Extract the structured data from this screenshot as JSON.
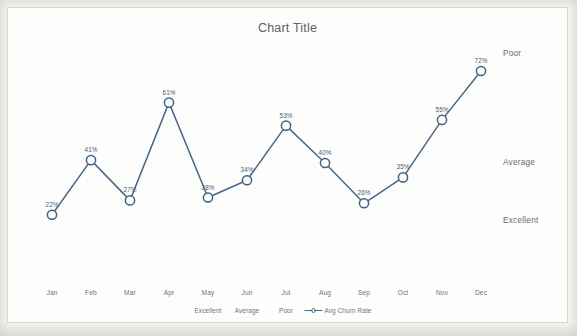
{
  "chart_data": {
    "type": "line",
    "title": "Chart Title",
    "xlabel": "",
    "ylabel": "",
    "ylim": [
      0,
      80
    ],
    "grid": false,
    "legend_position": "bottom",
    "categories": [
      "Jan",
      "Feb",
      "Mar",
      "Apr",
      "May",
      "Jun",
      "Jul",
      "Aug",
      "Sep",
      "Oct",
      "Nov",
      "Dec"
    ],
    "series": [
      {
        "name": "Avg Churn Rate",
        "values": [
          22,
          41,
          27,
          61,
          28,
          34,
          53,
          40,
          26,
          35,
          55,
          72
        ],
        "labels": [
          "22%",
          "41%",
          "27%",
          "61%",
          "28%",
          "34%",
          "53%",
          "40%",
          "26%",
          "35%",
          "55%",
          "72%"
        ],
        "color": "#46688c",
        "marker": "open-circle"
      }
    ],
    "zone_labels": [
      {
        "text": "Poor",
        "value": 78
      },
      {
        "text": "Average",
        "value": 40
      },
      {
        "text": "Excellent",
        "value": 20
      }
    ],
    "legend_entries": [
      {
        "label": "Excellent",
        "symbol": "none"
      },
      {
        "label": "Average",
        "symbol": "none"
      },
      {
        "label": "Poor",
        "symbol": "none"
      },
      {
        "label": "Avg Churn Rate",
        "symbol": "line-marker"
      }
    ]
  },
  "colors": {
    "line": "#46688c",
    "marker_stroke": "#3f6286",
    "marker_fill": "#fdfdfc",
    "text": "#70737a",
    "title": "#5e6063",
    "card_bg": "#fdfdfc",
    "card_border": "#d8d6d2",
    "page_bg": "#f4f3f1"
  }
}
